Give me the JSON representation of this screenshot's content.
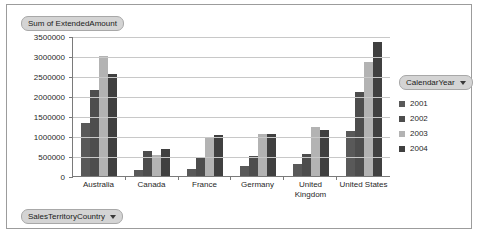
{
  "value_field_button": {
    "label": "Sum of ExtendedAmount"
  },
  "category_field_button": {
    "label": "SalesTerritoryCountry"
  },
  "legend_field_button": {
    "label": "CalendarYear"
  },
  "colors": {
    "series_2001": "#595959",
    "series_2002": "#4d4d4d",
    "series_2003": "#b3b3b3",
    "series_2004": "#404040",
    "gridline": "#c8c8c8",
    "axis": "#7a7a7a",
    "plot_background": "#ffffff",
    "frame_border": "#9c9c9c",
    "field_button_fill": "#d4d4d4"
  },
  "chart_data": {
    "type": "bar",
    "title": "Sum of ExtendedAmount",
    "xlabel": "SalesTerritoryCountry",
    "ylabel": "",
    "ylim": [
      0,
      3500000
    ],
    "ytick_step": 500000,
    "yticks": [
      "0",
      "500000",
      "1000000",
      "1500000",
      "2000000",
      "2500000",
      "3000000",
      "3500000"
    ],
    "grid": true,
    "legend_position": "right",
    "legend_title": "CalendarYear",
    "categories": [
      "Australia",
      "Canada",
      "France",
      "Germany",
      "United Kingdom",
      "United States"
    ],
    "series": [
      {
        "name": "2001",
        "color": "#595959",
        "values": [
          1320000,
          150000,
          180000,
          240000,
          290000,
          1120000
        ]
      },
      {
        "name": "2002",
        "color": "#4d4d4d",
        "values": [
          2160000,
          620000,
          450000,
          500000,
          560000,
          2110000
        ]
      },
      {
        "name": "2003",
        "color": "#b3b3b3",
        "values": [
          3010000,
          530000,
          960000,
          1060000,
          1230000,
          2850000
        ]
      },
      {
        "name": "2004",
        "color": "#404040",
        "values": [
          2560000,
          670000,
          1030000,
          1060000,
          1160000,
          3350000
        ]
      }
    ]
  }
}
